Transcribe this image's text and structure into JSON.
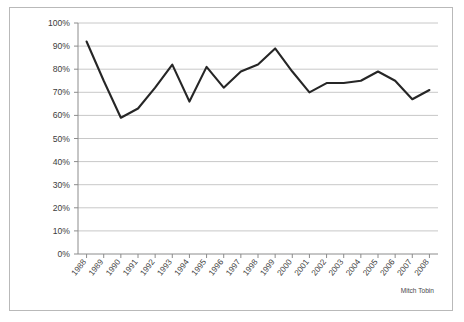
{
  "chart_data": {
    "type": "line",
    "title": "",
    "subtitle": "",
    "xlabel": "",
    "ylabel": "",
    "ylim": [
      0,
      1.0
    ],
    "y_tick_labels": [
      "0%",
      "10%",
      "20%",
      "30%",
      "40%",
      "50%",
      "60%",
      "70%",
      "80%",
      "90%",
      "100%"
    ],
    "y_tick_values": [
      0,
      10,
      20,
      30,
      40,
      50,
      60,
      70,
      80,
      90,
      100
    ],
    "grid": "horizontal",
    "legend": "none",
    "categories": [
      "1988",
      "1989",
      "1990",
      "1991",
      "1992",
      "1993",
      "1994",
      "1995",
      "1996",
      "1997",
      "1998",
      "1999",
      "2000",
      "2001",
      "2002",
      "2003",
      "2004",
      "2005",
      "2006",
      "2007",
      "2008"
    ],
    "values": [
      92,
      75,
      59,
      63,
      72,
      82,
      66,
      81,
      72,
      79,
      82,
      89,
      79,
      70,
      74,
      74,
      75,
      79,
      75,
      67,
      71
    ],
    "series": [
      {
        "name": "",
        "color": "#262626",
        "values": [
          92,
          75,
          59,
          63,
          72,
          82,
          66,
          81,
          72,
          79,
          82,
          89,
          79,
          70,
          74,
          74,
          75,
          79,
          75,
          67,
          71
        ]
      }
    ],
    "annotations": [
      {
        "text": "Mitch Tobin",
        "position": "bottom-right"
      }
    ],
    "colors": {
      "line": "#262626",
      "grid": "#c8c8c8",
      "axis": "#8c8c8c",
      "frame": "#b9b9b9",
      "background": "#ffffff",
      "tick_text": "#3c3c3c"
    }
  },
  "credit": {
    "label": "Mitch Tobin"
  }
}
